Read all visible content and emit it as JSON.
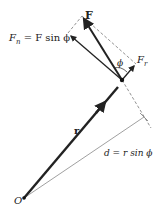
{
  "diagram": {
    "type": "torque-force-decomposition",
    "labels": {
      "F": "F",
      "Fn": "F",
      "Fn_sub": "n",
      "Fn_eq": " = F sin ϕ",
      "Fr": "F",
      "Fr_sub": "r",
      "phi": "ϕ",
      "r": "r",
      "d": "d = r  sin ϕ",
      "O": "O"
    },
    "points": {
      "origin": [
        24,
        198
      ],
      "application": [
        122,
        80
      ],
      "F_tip": [
        82,
        16
      ],
      "Fn_tip": [
        68,
        33
      ],
      "Fr_tip": [
        136,
        64
      ],
      "d_end": [
        144,
        117
      ]
    },
    "colors": {
      "vector": "#222222",
      "guide": "#777777"
    }
  }
}
